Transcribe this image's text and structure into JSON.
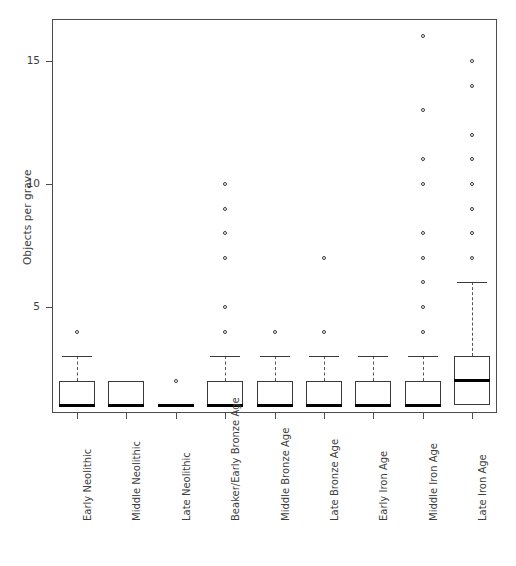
{
  "chart_data": {
    "type": "box",
    "title": "",
    "subtitle": "",
    "xlabel": "",
    "ylabel": "Objects per grave",
    "ylim": [
      0,
      16.8
    ],
    "yticks": [
      5,
      10,
      15
    ],
    "ytick_labels": [
      "5",
      "10",
      "15"
    ],
    "grid": false,
    "legend": null,
    "categories": [
      "Early Neolithic",
      "Middle Neolithic",
      "Late Neolithic",
      "Beaker/Early Bronze Age",
      "Middle Bronze Age",
      "Late Bronze Age",
      "Early Iron Age",
      "Middle Iron Age",
      "Late Iron Age"
    ],
    "boxes": [
      {
        "category": "Early Neolithic",
        "q1": 1,
        "median": 1,
        "q3": 2,
        "whisker_low": 1,
        "whisker_high": 3,
        "outliers": [
          4
        ]
      },
      {
        "category": "Middle Neolithic",
        "q1": 1,
        "median": 1,
        "q3": 2,
        "whisker_low": 1,
        "whisker_high": 2,
        "outliers": []
      },
      {
        "category": "Late Neolithic",
        "q1": 1,
        "median": 1,
        "q3": 1,
        "whisker_low": 1,
        "whisker_high": 1,
        "outliers": [
          2
        ]
      },
      {
        "category": "Beaker/Early Bronze Age",
        "q1": 1,
        "median": 1,
        "q3": 2,
        "whisker_low": 1,
        "whisker_high": 3,
        "outliers": [
          4,
          5,
          7,
          8,
          9,
          10
        ]
      },
      {
        "category": "Middle Bronze Age",
        "q1": 1,
        "median": 1,
        "q3": 2,
        "whisker_low": 1,
        "whisker_high": 3,
        "outliers": [
          4
        ]
      },
      {
        "category": "Late Bronze Age",
        "q1": 1,
        "median": 1,
        "q3": 2,
        "whisker_low": 1,
        "whisker_high": 3,
        "outliers": [
          4,
          7
        ]
      },
      {
        "category": "Early Iron Age",
        "q1": 1,
        "median": 1,
        "q3": 2,
        "whisker_low": 1,
        "whisker_high": 3,
        "outliers": []
      },
      {
        "category": "Middle Iron Age",
        "q1": 1,
        "median": 1,
        "q3": 2,
        "whisker_low": 1,
        "whisker_high": 3,
        "outliers": [
          4,
          5,
          6,
          7,
          8,
          10,
          11,
          13,
          16
        ]
      },
      {
        "category": "Late Iron Age",
        "q1": 1,
        "median": 2,
        "q3": 3,
        "whisker_low": 1,
        "whisker_high": 6,
        "outliers": [
          7,
          8,
          9,
          10,
          11,
          12,
          14,
          15
        ]
      }
    ],
    "colors": {
      "axis": "#4c4c4c",
      "box_edge": "#3a3a3a",
      "median": "#000000",
      "outlier_edge": "#3a3a3a",
      "background": "#ffffff"
    }
  }
}
